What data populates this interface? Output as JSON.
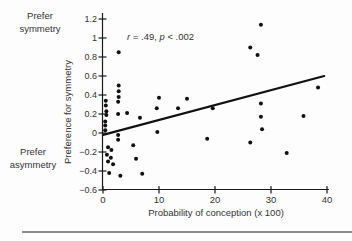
{
  "figure": {
    "background": "#fdfdfd",
    "divider_color": "#8c8c8c",
    "text_color": "#333333"
  },
  "chart_data": {
    "type": "scatter",
    "title": "",
    "xlabel": "Probability of conception (x 100)",
    "ylabel": "Preference for symmetry",
    "xlim": [
      0,
      40
    ],
    "ylim": [
      -0.6,
      1.2
    ],
    "grid": false,
    "legend": null,
    "x_ticks": [
      0,
      10,
      20,
      30,
      40
    ],
    "x_tick_labels": [
      "0",
      "10",
      "20",
      "30",
      "40"
    ],
    "y_ticks": [
      1.2,
      1.0,
      0.8,
      0.6,
      0.4,
      0.2,
      0.0,
      -0.2,
      -0.4,
      -0.6
    ],
    "y_tick_labels": [
      "1.2",
      "1",
      "0.8",
      "0.6",
      "0.4",
      "0.2",
      "0",
      "−0.2",
      "−0.4",
      "−0.6"
    ],
    "annotation": {
      "full_text": "r = .49, p < .002",
      "r_var": "r",
      "r_value": " = .49, ",
      "p_var": "p",
      "p_value": " < .002"
    },
    "corner_labels": {
      "top": [
        "Prefer",
        "symmetry"
      ],
      "bottom": [
        "Prefer",
        "asymmetry"
      ]
    },
    "point_color": "#111111",
    "regression_line": {
      "x1": 0,
      "y1": -0.02,
      "x2": 39.5,
      "y2": 0.6
    },
    "points": [
      [
        0.5,
        0.34
      ],
      [
        0.5,
        0.29
      ],
      [
        0.6,
        0.23
      ],
      [
        0.6,
        0.19
      ],
      [
        0.4,
        0.12
      ],
      [
        0.4,
        0.08
      ],
      [
        0.4,
        0.03
      ],
      [
        0.9,
        -0.15
      ],
      [
        1.5,
        -0.18
      ],
      [
        0.7,
        -0.23
      ],
      [
        1.4,
        -0.26
      ],
      [
        0.9,
        -0.3
      ],
      [
        1.8,
        -0.33
      ],
      [
        1.1,
        -0.42
      ],
      [
        2.8,
        0.85
      ],
      [
        2.8,
        0.5
      ],
      [
        2.8,
        0.44
      ],
      [
        2.8,
        0.38
      ],
      [
        2.7,
        0.33
      ],
      [
        2.7,
        0.2
      ],
      [
        2.7,
        -0.02
      ],
      [
        2.7,
        -0.07
      ],
      [
        3.1,
        -0.45
      ],
      [
        4.3,
        0.21
      ],
      [
        6.6,
        0.16
      ],
      [
        5.4,
        -0.13
      ],
      [
        5.9,
        -0.27
      ],
      [
        7.0,
        -0.43
      ],
      [
        10.0,
        0.37
      ],
      [
        9.6,
        0.26
      ],
      [
        9.7,
        0.01
      ],
      [
        13.4,
        0.26
      ],
      [
        15.0,
        0.36
      ],
      [
        18.6,
        -0.06
      ],
      [
        19.6,
        0.26
      ],
      [
        28.2,
        1.14
      ],
      [
        26.3,
        0.9
      ],
      [
        27.6,
        0.82
      ],
      [
        28.2,
        0.31
      ],
      [
        28.2,
        0.17
      ],
      [
        28.4,
        0.04
      ],
      [
        26.3,
        -0.1
      ],
      [
        32.8,
        -0.21
      ],
      [
        35.8,
        0.18
      ],
      [
        38.4,
        0.48
      ]
    ]
  }
}
